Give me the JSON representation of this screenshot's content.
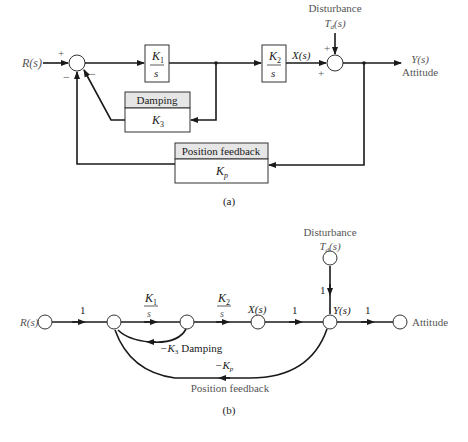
{
  "figure_a": {
    "input_label": "R(s)",
    "sum1_signs": {
      "top": "+",
      "bottom_left": "−",
      "bottom_right": "−"
    },
    "block_k1": {
      "numerator": "K",
      "num_sub": "1",
      "denominator": "s"
    },
    "block_k2": {
      "numerator": "K",
      "num_sub": "2",
      "denominator": "s"
    },
    "intermediate_label": "X(s)",
    "disturbance": {
      "title": "Disturbance",
      "symbol": "T",
      "sub": "d",
      "arg": "(s)"
    },
    "sum2_signs": {
      "top": "+",
      "left": "+"
    },
    "output_label": "Y(s)",
    "output_name": "Attitude",
    "damping_block": {
      "header": "Damping",
      "gain": "K",
      "gain_sub": "3"
    },
    "position_block": {
      "header": "Position feedback",
      "gain": "K",
      "gain_sub": "p"
    },
    "caption": "(a)"
  },
  "figure_b": {
    "disturbance": {
      "title": "Disturbance",
      "symbol": "T",
      "sub": "d",
      "arg": "(s)"
    },
    "input_label": "R(s)",
    "branch_gains": {
      "input": "1",
      "k1": {
        "numerator": "K",
        "num_sub": "1",
        "denominator": "s"
      },
      "k2": {
        "numerator": "K",
        "num_sub": "2",
        "denominator": "s"
      },
      "x_to_y": "1",
      "disturbance": "1",
      "output": "1"
    },
    "node_labels": {
      "x": "X(s)",
      "y": "Y(s)"
    },
    "output_name": "Attitude",
    "damping_loop": {
      "gain": "−K",
      "gain_sub": "3",
      "name": "Damping"
    },
    "position_loop": {
      "gain": "−K",
      "gain_sub": "p",
      "name": "Position feedback"
    },
    "caption": "(b)"
  }
}
